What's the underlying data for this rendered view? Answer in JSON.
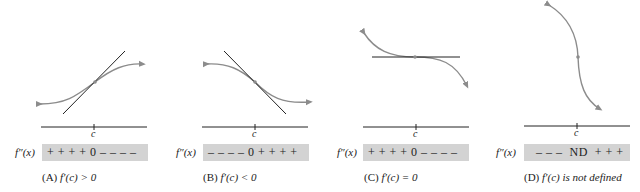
{
  "panels": [
    {
      "id": "A",
      "row_label": "f″(x)",
      "signs": "+ + + + 0 – – – –",
      "c_label": "c",
      "caption_prefix": "(A)",
      "caption_expr": "f′(c) > 0"
    },
    {
      "id": "B",
      "row_label": "f″(x)",
      "signs": "– – – – 0 + + + +",
      "c_label": "c",
      "caption_prefix": "(B)",
      "caption_expr": "f′(c) < 0"
    },
    {
      "id": "C",
      "row_label": "f″(x)",
      "signs": "+ + + + 0 – – – –",
      "c_label": "c",
      "caption_prefix": "(C)",
      "caption_expr": "f′(c) = 0"
    },
    {
      "id": "D",
      "row_label": "f″(x)",
      "signs": "– – –  ND  + + +",
      "c_label": "c",
      "caption_prefix": "(D)",
      "caption_expr": "f′(c) is not defined"
    }
  ],
  "colors": {
    "curve": "#8c8c8c",
    "tangent": "#222222",
    "axis": "#222222",
    "sign_bar": "#d3d3d3"
  }
}
